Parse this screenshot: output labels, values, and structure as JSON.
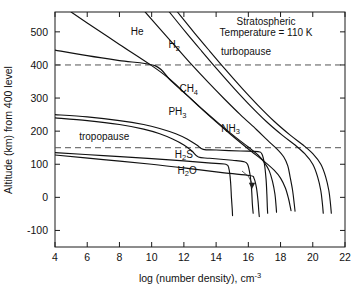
{
  "chart_data": {
    "type": "line",
    "title": "",
    "xlabel": "log (number density), cm",
    "xlabel_sup": "-3",
    "ylabel": "Altitude (km) from 400  level",
    "xlim": [
      4,
      22
    ],
    "ylim": [
      -150,
      560
    ],
    "xticks": [
      4,
      6,
      8,
      10,
      12,
      14,
      16,
      18,
      20,
      22
    ],
    "xtick_labels": [
      "4",
      "6",
      "8",
      "10",
      "12",
      "14",
      "16",
      "18",
      "20",
      "22"
    ],
    "yticks": [
      -100,
      0,
      100,
      200,
      300,
      400,
      500
    ],
    "ytick_labels": [
      "-100",
      "0",
      "100",
      "200",
      "300",
      "400",
      "500"
    ],
    "grid": false,
    "legend_position": "inline-curve-labels",
    "annotations": [
      {
        "name": "stratospheric-temperature-note",
        "line1": "Stratospheric",
        "line2": "Temperature = 110 K",
        "x": 17.1,
        "y": 520
      },
      {
        "name": "turbopause-label",
        "text": "turbopause",
        "x": 14.3,
        "y": 430
      },
      {
        "name": "tropopause-label",
        "text": "tropopause",
        "x": 5.5,
        "y": 172
      }
    ],
    "reference_lines": [
      {
        "name": "turbopause",
        "axis": "y",
        "value": 400,
        "style": "dashed",
        "label": "turbopause"
      },
      {
        "name": "tropopause",
        "axis": "y",
        "value": 150,
        "style": "dashed",
        "label": "tropopause"
      }
    ],
    "series": [
      {
        "name": "He",
        "label": "He",
        "label_base": "He",
        "label_sub": "",
        "label_x": 9.1,
        "label_y": 492,
        "points": [
          [
            5.0,
            560
          ],
          [
            6.0,
            527
          ],
          [
            8.0,
            462
          ],
          [
            10.0,
            398
          ],
          [
            11.0,
            362
          ],
          [
            12.0,
            318
          ],
          [
            13.0,
            272
          ],
          [
            14.0,
            228
          ],
          [
            15.0,
            186
          ],
          [
            16.0,
            146
          ],
          [
            17.0,
            108
          ],
          [
            17.6,
            82
          ],
          [
            18.0,
            58
          ],
          [
            18.3,
            28
          ],
          [
            18.5,
            -5
          ],
          [
            18.6,
            -28
          ],
          [
            18.65,
            -40
          ]
        ]
      },
      {
        "name": "H2",
        "label": "H2",
        "label_base": "H",
        "label_sub": "2",
        "label_x": 11.4,
        "label_y": 450,
        "points": [
          [
            9.6,
            560
          ],
          [
            10.5,
            510
          ],
          [
            11.5,
            455
          ],
          [
            12.5,
            400
          ],
          [
            13.5,
            348
          ],
          [
            14.5,
            298
          ],
          [
            15.5,
            250
          ],
          [
            16.5,
            205
          ],
          [
            17.2,
            172
          ],
          [
            17.8,
            145
          ],
          [
            18.2,
            122
          ],
          [
            18.45,
            95
          ],
          [
            18.6,
            60
          ],
          [
            18.75,
            20
          ],
          [
            18.85,
            -20
          ],
          [
            18.9,
            -42
          ]
        ]
      },
      {
        "name": "CH4",
        "label": "CH4",
        "label_base": "CH",
        "label_sub": "4",
        "label_x": 12.3,
        "label_y": 318,
        "points": [
          [
            4.0,
            445
          ],
          [
            6.0,
            428
          ],
          [
            8.0,
            413
          ],
          [
            10.2,
            398
          ],
          [
            11.2,
            352
          ],
          [
            12.2,
            308
          ],
          [
            13.2,
            264
          ],
          [
            14.2,
            222
          ],
          [
            15.2,
            182
          ],
          [
            16.0,
            152
          ],
          [
            16.6,
            128
          ],
          [
            17.0,
            105
          ],
          [
            17.3,
            80
          ],
          [
            17.5,
            48
          ],
          [
            17.65,
            10
          ],
          [
            17.72,
            -25
          ],
          [
            17.75,
            -45
          ]
        ]
      },
      {
        "name": "NH3-upper",
        "label": "NH3",
        "label_base": "NH",
        "label_sub": "3",
        "label_x": 14.9,
        "label_y": 198,
        "points": [
          [
            11.6,
            560
          ],
          [
            12.6,
            500
          ],
          [
            13.6,
            442
          ],
          [
            14.6,
            385
          ],
          [
            15.6,
            330
          ],
          [
            16.6,
            278
          ],
          [
            17.6,
            230
          ],
          [
            18.6,
            188
          ],
          [
            19.4,
            158
          ],
          [
            20.0,
            132
          ],
          [
            20.5,
            100
          ],
          [
            20.8,
            62
          ],
          [
            21.0,
            20
          ],
          [
            21.1,
            -20
          ],
          [
            21.15,
            -48
          ]
        ]
      },
      {
        "name": "NH3-lower",
        "label": "",
        "label_base": "",
        "label_sub": "",
        "label_x": null,
        "label_y": null,
        "points": [
          [
            11.1,
            560
          ],
          [
            12.1,
            500
          ],
          [
            13.1,
            442
          ],
          [
            14.1,
            385
          ],
          [
            15.1,
            330
          ],
          [
            16.1,
            278
          ],
          [
            17.1,
            230
          ],
          [
            18.1,
            188
          ],
          [
            18.9,
            158
          ],
          [
            19.5,
            132
          ],
          [
            20.0,
            100
          ],
          [
            20.3,
            62
          ],
          [
            20.5,
            20
          ],
          [
            20.6,
            -20
          ],
          [
            20.65,
            -48
          ]
        ]
      },
      {
        "name": "PH3-upper",
        "label": "PH3",
        "label_base": "PH",
        "label_sub": "3",
        "label_x": 11.6,
        "label_y": 248,
        "points": [
          [
            4.0,
            250
          ],
          [
            6.0,
            243
          ],
          [
            8.0,
            232
          ],
          [
            9.5,
            220
          ],
          [
            10.5,
            208
          ],
          [
            11.5,
            192
          ],
          [
            12.2,
            176
          ],
          [
            12.8,
            158
          ],
          [
            13.2,
            145
          ],
          [
            14.0,
            143
          ],
          [
            15.5,
            140
          ],
          [
            16.6,
            138
          ],
          [
            16.85,
            130
          ],
          [
            17.0,
            100
          ],
          [
            17.1,
            55
          ],
          [
            17.15,
            10
          ],
          [
            17.18,
            -30
          ],
          [
            17.2,
            -48
          ]
        ]
      },
      {
        "name": "PH3-lower",
        "label": "",
        "label_base": "",
        "label_sub": "",
        "label_x": null,
        "label_y": null,
        "points": [
          [
            4.0,
            240
          ],
          [
            6.0,
            232
          ],
          [
            8.0,
            220
          ],
          [
            9.5,
            206
          ],
          [
            10.5,
            192
          ],
          [
            11.3,
            176
          ],
          [
            12.0,
            158
          ],
          [
            12.5,
            140
          ],
          [
            12.9,
            122
          ],
          [
            13.6,
            118
          ],
          [
            15.0,
            112
          ],
          [
            15.7,
            108
          ],
          [
            15.95,
            100
          ],
          [
            16.1,
            70
          ],
          [
            16.2,
            25
          ],
          [
            16.25,
            -20
          ],
          [
            16.3,
            -48
          ]
        ]
      },
      {
        "name": "H2S",
        "label": "H2S",
        "label_base": "H",
        "label_sub": "2",
        "label_tail": "S",
        "label_x": 12.0,
        "label_y": 120,
        "points": [
          [
            4.0,
            135
          ],
          [
            7.0,
            126
          ],
          [
            10.0,
            117
          ],
          [
            12.0,
            110
          ],
          [
            13.5,
            104
          ],
          [
            14.6,
            100
          ],
          [
            14.8,
            85
          ],
          [
            14.9,
            45
          ],
          [
            14.95,
            0
          ],
          [
            15.0,
            -35
          ],
          [
            15.02,
            -55
          ]
        ]
      },
      {
        "name": "H2O",
        "label": "H2O",
        "label_base": "H",
        "label_sub": "2",
        "label_tail": "O",
        "label_x": 12.2,
        "label_y": 72,
        "points": [
          [
            4.0,
            128
          ],
          [
            7.0,
            114
          ],
          [
            10.0,
            100
          ],
          [
            12.5,
            86
          ],
          [
            14.5,
            74
          ],
          [
            16.1,
            66
          ],
          [
            16.35,
            58
          ],
          [
            16.5,
            30
          ],
          [
            16.6,
            -10
          ],
          [
            16.65,
            -42
          ],
          [
            16.68,
            -58
          ]
        ]
      }
    ]
  },
  "figure": {
    "background": "#ffffff",
    "line_color": "#111111",
    "refline_color": "#555555"
  }
}
